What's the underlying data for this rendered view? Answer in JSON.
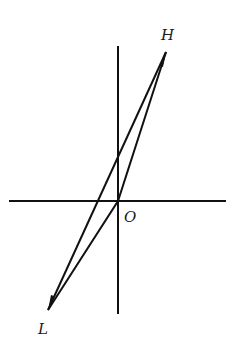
{
  "diagram": {
    "type": "hysteresis-loop",
    "labels": {
      "top_point": "H",
      "bottom_point": "L",
      "origin": "O"
    },
    "colors": {
      "stroke": "#111111",
      "background": "#ffffff"
    }
  }
}
